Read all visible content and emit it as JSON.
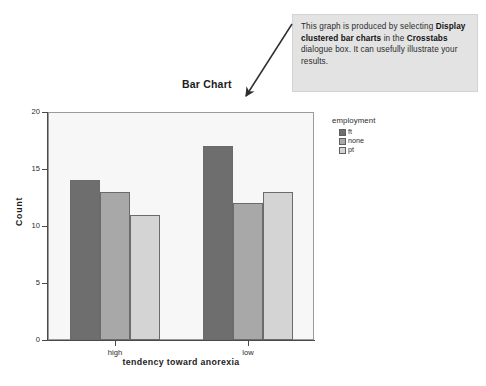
{
  "callout": {
    "text_parts": [
      {
        "t": "This graph is produced by selecting ",
        "bold": false
      },
      {
        "t": "Display clustered bar charts",
        "bold": true
      },
      {
        "t": " in the ",
        "bold": false
      },
      {
        "t": "Crosstabs",
        "bold": true
      },
      {
        "t": " dialogue box. It can usefully illustrate your results.",
        "bold": false
      }
    ],
    "plain_text": "This graph is produced by selecting Display clustered bar charts in the Crosstabs dialogue box. It can usefully illustrate your results.",
    "background_color": "#e3e3e3",
    "arrow_icon": "arrow-pointing-down-left"
  },
  "chart_data": {
    "type": "bar",
    "title": "Bar Chart",
    "xlabel": "tendency toward anorexia",
    "ylabel": "Count",
    "categories": [
      "high",
      "low"
    ],
    "legend_title": "employment",
    "legend_position": "right",
    "grid": false,
    "ylim": [
      0,
      20
    ],
    "yticks": [
      0,
      5,
      10,
      15,
      20
    ],
    "ytick_labels": [
      "0",
      "5",
      "10",
      "15",
      "20"
    ],
    "series": [
      {
        "name": "ft",
        "values": [
          14,
          17
        ],
        "color": "#6e6e6e"
      },
      {
        "name": "none",
        "values": [
          13,
          12
        ],
        "color": "#a8a8a8"
      },
      {
        "name": "pt",
        "values": [
          11,
          13
        ],
        "color": "#d4d4d4"
      }
    ],
    "plot_background": "#f7f7f7",
    "axis_color": "#4a4a4a"
  }
}
